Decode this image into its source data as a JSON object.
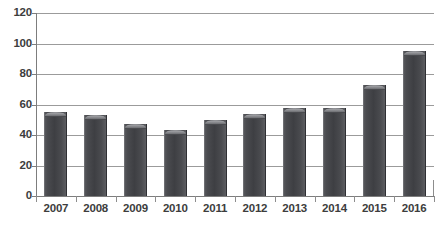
{
  "chart_data": {
    "type": "bar",
    "title": "",
    "subtitle": "",
    "xlabel": "",
    "ylabel": "",
    "categories": [
      "2007",
      "2008",
      "2009",
      "2010",
      "2011",
      "2012",
      "2013",
      "2014",
      "2015",
      "2016"
    ],
    "values": [
      55,
      53,
      47,
      43,
      50,
      54,
      58,
      58,
      73,
      95
    ],
    "series": [
      {
        "name": "Series 1",
        "values": [
          55,
          53,
          47,
          43,
          50,
          54,
          58,
          58,
          73,
          95
        ],
        "color": "#46474b"
      }
    ],
    "ylim": [
      0,
      120
    ],
    "ytick_values": [
      0,
      20,
      40,
      60,
      80,
      100,
      120
    ],
    "ytick_labels": [
      "0",
      "20",
      "40",
      "60",
      "80",
      "100",
      "120"
    ],
    "grid": true,
    "grid_axis": "y",
    "legend": false,
    "legend_position": "none",
    "bar_style": "3d-cylinder",
    "colors": {
      "bar_fill": "#46474b",
      "bar_cap": "#8f9094",
      "gridline": "#9b9b9b",
      "axis": "#7d7d7d",
      "text": "#3d3d3d",
      "background": "#ffffff"
    }
  }
}
